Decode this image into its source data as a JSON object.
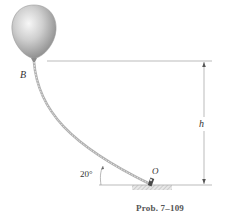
{
  "figure": {
    "caption": "Prob. 7–109",
    "labels": {
      "balloon_point": "B",
      "height": "h",
      "angle": "20°",
      "anchor_point": "O"
    },
    "colors": {
      "balloon_light": "#f2f2f2",
      "balloon_dark": "#8f8f8f",
      "rope": "#b5b5b5",
      "lines": "#999999",
      "ground_hatch": "#b8b8b8",
      "text": "#333333"
    },
    "geometry": {
      "rope_angle_at_O_deg": 20
    }
  }
}
